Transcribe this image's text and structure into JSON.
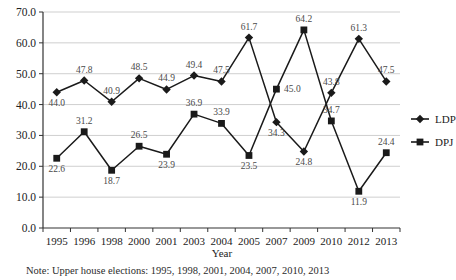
{
  "chart_data": {
    "type": "line",
    "title": "",
    "xlabel": "Year",
    "ylabel": "",
    "categories": [
      "1995",
      "1996",
      "1998",
      "2000",
      "2001",
      "2003",
      "2004",
      "2005",
      "2007",
      "2009",
      "2010",
      "2012",
      "2013"
    ],
    "series": [
      {
        "name": "LDP",
        "marker": "diamond",
        "color": "#1a1a1a",
        "values": [
          44.0,
          47.8,
          40.9,
          48.5,
          44.9,
          49.4,
          47.5,
          61.7,
          34.3,
          24.8,
          43.8,
          61.3,
          47.5
        ]
      },
      {
        "name": "DPJ",
        "marker": "square",
        "color": "#1a1a1a",
        "values": [
          22.6,
          31.2,
          18.7,
          26.5,
          23.9,
          36.9,
          33.9,
          23.5,
          45.0,
          64.2,
          34.7,
          11.9,
          24.4
        ]
      }
    ],
    "ylim": [
      0,
      70
    ],
    "ytick_step": 10,
    "ytick_labels": [
      "0.0",
      "10.0",
      "20.0",
      "30.0",
      "40.0",
      "50.0",
      "60.0",
      "70.0"
    ],
    "grid": true,
    "grid_axis": "y",
    "legend_position": "right",
    "data_labels": true
  },
  "legend": {
    "items": [
      {
        "label": "LDP",
        "marker": "diamond"
      },
      {
        "label": "DPJ",
        "marker": "square"
      }
    ]
  },
  "note": {
    "text": "Note: Upper house elections: 1995, 1998, 2001, 2004, 2007, 2010, 2013"
  }
}
